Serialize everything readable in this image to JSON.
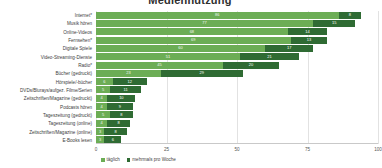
{
  "chart_data": {
    "type": "bar",
    "orientation": "horizontal",
    "stacked": true,
    "title": "",
    "xlabel": "",
    "ylabel": "",
    "xlim": [
      0,
      100
    ],
    "xticks": [
      "0",
      "25",
      "50",
      "75",
      "100"
    ],
    "grid": true,
    "legend_position": "bottom-left",
    "categories": [
      "Internet*",
      "Musik hören",
      "Online-Videos",
      "Fernsehen*",
      "Digitale Spiele",
      "Video-Streaming-Dienste",
      "Radio*",
      "Bücher (gedruckt)",
      "Hörspiele/-bücher",
      "DVDs/Blurays/aufgez. Filme/Serien",
      "Zeitschriften/Magazine (gedruckt)",
      "Podcasts hören",
      "Tageszeitung (gedruckt)",
      "Tageszeitung (online)",
      "Zeitschriften/Magazine (online)",
      "E-Books lesen"
    ],
    "series": [
      {
        "name": "täglich",
        "color": "#6cad55",
        "values": [
          86,
          77,
          68,
          69,
          60,
          51,
          45,
          23,
          6,
          5,
          4,
          4,
          5,
          4,
          3,
          3
        ]
      },
      {
        "name": "mehrmals pro Woche",
        "color": "#2f6b33",
        "values": [
          8,
          15,
          14,
          13,
          17,
          21,
          20,
          29,
          12,
          11,
          10,
          9,
          8,
          8,
          8,
          6
        ]
      }
    ],
    "totals": [
      94,
      92,
      82,
      82,
      77,
      72,
      65,
      52,
      18,
      16,
      14,
      13,
      13,
      12,
      11,
      9
    ]
  },
  "legend": {
    "items": [
      {
        "label": "täglich"
      },
      {
        "label": "mehrmals pro Woche"
      }
    ]
  },
  "title_sliver": "Mediennutzung"
}
